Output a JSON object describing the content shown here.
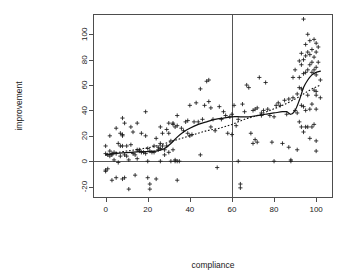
{
  "figure": {
    "background_color": "#ffffff",
    "plot_region": {
      "left": 93,
      "top": 14,
      "right": 333,
      "bottom": 198
    },
    "point_symbol": "plus",
    "point_color": "#1a1a1a",
    "frame_color": "#4d4d4d",
    "reference_line_color": "#555555"
  },
  "chart_data": {
    "type": "scatter",
    "title": "",
    "subtitle": "",
    "xlabel": "compliance",
    "ylabel": "improvement",
    "xlim": [
      -6,
      108
    ],
    "ylim": [
      -29,
      116
    ],
    "xticks": [
      0,
      20,
      40,
      60,
      80,
      100
    ],
    "yticks": [
      -20,
      0,
      20,
      40,
      60,
      80,
      100
    ],
    "xtick_labels": [
      "0",
      "20",
      "40",
      "60",
      "80",
      "100"
    ],
    "ytick_labels": [
      "-20",
      "0",
      "20",
      "40",
      "60",
      "80",
      "100"
    ],
    "grid": false,
    "legend": null,
    "legend_position": "none",
    "ylabel_rotation": 90,
    "ytick_label_rotation": 90,
    "annotations": [
      {
        "name": "zero-improvement-line",
        "type": "hline",
        "y": 0,
        "style": "solid"
      },
      {
        "name": "compliance-threshold-line",
        "type": "vline",
        "x": 60,
        "style": "solid"
      }
    ],
    "series": [
      {
        "name": "observations",
        "marker": "plus",
        "points": [
          [
            0,
            12
          ],
          [
            0,
            -7
          ],
          [
            0,
            -8
          ],
          [
            0,
            6
          ],
          [
            1,
            5
          ],
          [
            1,
            -6
          ],
          [
            2,
            8
          ],
          [
            2,
            4
          ],
          [
            2,
            20
          ],
          [
            3,
            6
          ],
          [
            3,
            5
          ],
          [
            3,
            -15
          ],
          [
            4,
            7
          ],
          [
            4,
            1
          ],
          [
            5,
            26
          ],
          [
            5,
            -13
          ],
          [
            5,
            6
          ],
          [
            6,
            14
          ],
          [
            6,
            -1
          ],
          [
            7,
            22
          ],
          [
            7,
            12
          ],
          [
            7,
            4
          ],
          [
            8,
            34
          ],
          [
            8,
            21
          ],
          [
            8,
            20
          ],
          [
            8,
            12
          ],
          [
            8,
            -14
          ],
          [
            9,
            30
          ],
          [
            9,
            5
          ],
          [
            9,
            -13
          ],
          [
            10,
            12
          ],
          [
            10,
            4
          ],
          [
            11,
            1
          ],
          [
            11,
            -22
          ],
          [
            12,
            27
          ],
          [
            12,
            13
          ],
          [
            13,
            23
          ],
          [
            13,
            6
          ],
          [
            14,
            5
          ],
          [
            14,
            -11
          ],
          [
            15,
            30
          ],
          [
            15,
            9
          ],
          [
            15,
            2
          ],
          [
            16,
            9
          ],
          [
            16,
            8
          ],
          [
            17,
            22
          ],
          [
            17,
            7
          ],
          [
            18,
            7
          ],
          [
            19,
            39
          ],
          [
            19,
            20
          ],
          [
            19,
            6
          ],
          [
            20,
            10
          ],
          [
            20,
            0
          ],
          [
            20,
            -13
          ],
          [
            21,
            8
          ],
          [
            21,
            -18
          ],
          [
            21,
            -22
          ],
          [
            22,
            7
          ],
          [
            23,
            12
          ],
          [
            23,
            7
          ],
          [
            24,
            18
          ],
          [
            24,
            -14
          ],
          [
            25,
            11
          ],
          [
            25,
            9
          ],
          [
            26,
            27
          ],
          [
            26,
            14
          ],
          [
            26,
            10
          ],
          [
            26,
            0
          ],
          [
            27,
            22
          ],
          [
            27,
            12
          ],
          [
            28,
            9
          ],
          [
            28,
            5
          ],
          [
            29,
            25
          ],
          [
            29,
            12
          ],
          [
            30,
            30
          ],
          [
            30,
            22
          ],
          [
            30,
            7
          ],
          [
            31,
            16
          ],
          [
            31,
            0
          ],
          [
            32,
            30
          ],
          [
            32,
            29
          ],
          [
            32,
            9
          ],
          [
            33,
            27
          ],
          [
            33,
            1
          ],
          [
            33,
            0
          ],
          [
            34,
            36
          ],
          [
            34,
            28
          ],
          [
            34,
            0
          ],
          [
            34,
            -15
          ],
          [
            35,
            0
          ],
          [
            36,
            26
          ],
          [
            37,
            24
          ],
          [
            38,
            31
          ],
          [
            39,
            32
          ],
          [
            39,
            22
          ],
          [
            40,
            44
          ],
          [
            40,
            20
          ],
          [
            41,
            21
          ],
          [
            42,
            31
          ],
          [
            43,
            46
          ],
          [
            44,
            31
          ],
          [
            45,
            57
          ],
          [
            45,
            5
          ],
          [
            46,
            33
          ],
          [
            47,
            44
          ],
          [
            48,
            63
          ],
          [
            49,
            64
          ],
          [
            49,
            47
          ],
          [
            50,
            42
          ],
          [
            50,
            27
          ],
          [
            51,
            33
          ],
          [
            52,
            24
          ],
          [
            53,
            -5
          ],
          [
            54,
            43
          ],
          [
            55,
            33
          ],
          [
            56,
            39
          ],
          [
            57,
            36
          ],
          [
            58,
            22
          ],
          [
            59,
            35
          ],
          [
            60,
            37
          ],
          [
            60,
            21
          ],
          [
            61,
            44
          ],
          [
            62,
            28
          ],
          [
            63,
            33
          ],
          [
            63,
            0
          ],
          [
            64,
            -18
          ],
          [
            64,
            -21
          ],
          [
            65,
            45
          ],
          [
            66,
            39
          ],
          [
            67,
            60
          ],
          [
            68,
            58
          ],
          [
            69,
            22
          ],
          [
            70,
            40
          ],
          [
            70,
            14
          ],
          [
            71,
            41
          ],
          [
            71,
            17
          ],
          [
            72,
            42
          ],
          [
            72,
            15
          ],
          [
            73,
            66
          ],
          [
            74,
            38
          ],
          [
            74,
            36
          ],
          [
            75,
            40
          ],
          [
            76,
            62
          ],
          [
            77,
            41
          ],
          [
            78,
            36
          ],
          [
            79,
            15
          ],
          [
            80,
            35
          ],
          [
            80,
            0
          ],
          [
            81,
            44
          ],
          [
            82,
            46
          ],
          [
            83,
            44
          ],
          [
            84,
            14
          ],
          [
            85,
            48
          ],
          [
            86,
            37
          ],
          [
            87,
            49
          ],
          [
            87,
            11
          ],
          [
            88,
            0
          ],
          [
            88,
            1
          ],
          [
            89,
            66
          ],
          [
            89,
            50
          ],
          [
            90,
            72
          ],
          [
            90,
            40
          ],
          [
            91,
            53
          ],
          [
            91,
            38
          ],
          [
            91,
            9
          ],
          [
            92,
            79
          ],
          [
            92,
            66
          ],
          [
            92,
            58
          ],
          [
            92,
            31
          ],
          [
            93,
            85
          ],
          [
            93,
            76
          ],
          [
            93,
            57
          ],
          [
            93,
            44
          ],
          [
            93,
            27
          ],
          [
            94,
            112
          ],
          [
            94,
            80
          ],
          [
            94,
            69
          ],
          [
            94,
            43
          ],
          [
            94,
            23
          ],
          [
            95,
            92
          ],
          [
            95,
            83
          ],
          [
            95,
            70
          ],
          [
            95,
            40
          ],
          [
            95,
            27
          ],
          [
            96,
            100
          ],
          [
            96,
            86
          ],
          [
            96,
            72
          ],
          [
            96,
            52
          ],
          [
            96,
            27
          ],
          [
            97,
            95
          ],
          [
            97,
            84
          ],
          [
            97,
            76
          ],
          [
            97,
            41
          ],
          [
            97,
            18
          ],
          [
            98,
            88
          ],
          [
            98,
            78
          ],
          [
            98,
            70
          ],
          [
            98,
            45
          ],
          [
            98,
            27
          ],
          [
            99,
            96
          ],
          [
            99,
            82
          ],
          [
            99,
            72
          ],
          [
            99,
            56
          ],
          [
            99,
            29
          ],
          [
            100,
            93
          ],
          [
            100,
            86
          ],
          [
            100,
            74
          ],
          [
            100,
            68
          ],
          [
            100,
            55
          ],
          [
            100,
            52
          ],
          [
            100,
            41
          ],
          [
            100,
            16
          ],
          [
            100,
            8
          ],
          [
            101,
            90
          ],
          [
            101,
            78
          ],
          [
            102,
            64
          ],
          [
            102,
            50
          ]
        ]
      }
    ],
    "fits": [
      {
        "name": "loess-smoother",
        "style": "solid",
        "points": [
          [
            0,
            5
          ],
          [
            4,
            6
          ],
          [
            8,
            6.5
          ],
          [
            12,
            7
          ],
          [
            16,
            7.5
          ],
          [
            20,
            7.5
          ],
          [
            24,
            8
          ],
          [
            28,
            10
          ],
          [
            31,
            14
          ],
          [
            34,
            19
          ],
          [
            37,
            23
          ],
          [
            40,
            26
          ],
          [
            44,
            29
          ],
          [
            48,
            31
          ],
          [
            52,
            33
          ],
          [
            56,
            34
          ],
          [
            60,
            35
          ],
          [
            64,
            35
          ],
          [
            68,
            35
          ],
          [
            72,
            36
          ],
          [
            76,
            37
          ],
          [
            80,
            38
          ],
          [
            84,
            39
          ],
          [
            86,
            39
          ],
          [
            88,
            37
          ],
          [
            90,
            40
          ],
          [
            92,
            48
          ],
          [
            94,
            58
          ],
          [
            96,
            64
          ],
          [
            98,
            68
          ],
          [
            100,
            70
          ],
          [
            102,
            71
          ]
        ]
      },
      {
        "name": "reference-smoother",
        "style": "dotted",
        "points": [
          [
            0,
            5
          ],
          [
            6,
            7
          ],
          [
            12,
            8.5
          ],
          [
            18,
            10
          ],
          [
            24,
            12
          ],
          [
            30,
            15
          ],
          [
            36,
            18
          ],
          [
            42,
            21
          ],
          [
            48,
            24
          ],
          [
            54,
            26
          ],
          [
            60,
            29
          ],
          [
            66,
            33
          ],
          [
            72,
            36
          ],
          [
            78,
            40
          ],
          [
            84,
            44
          ],
          [
            90,
            49
          ],
          [
            94,
            53
          ],
          [
            98,
            57
          ],
          [
            102,
            60
          ]
        ]
      }
    ]
  }
}
